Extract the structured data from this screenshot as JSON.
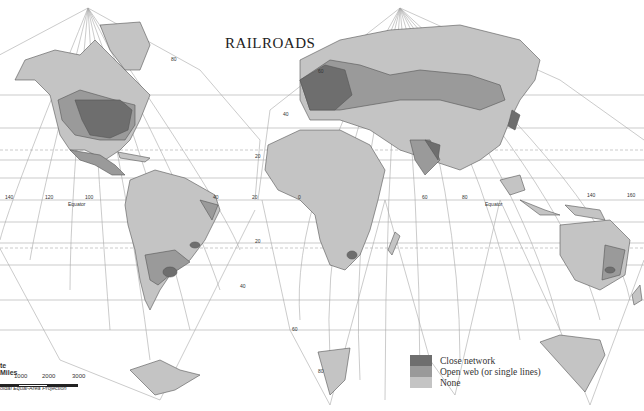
{
  "map": {
    "title": "RAILROADS",
    "projection": "Interrupted Homolosine (Goode) — Equal-Area Projection",
    "projection_label_visible": "oidal Equal-Area Projection",
    "equator_label": "Equator",
    "longitude_labels": [
      "140",
      "120",
      "100",
      "80",
      "40",
      "20",
      "0",
      "20",
      "60",
      "80",
      "140",
      "160"
    ],
    "latitude_labels": [
      "80",
      "60",
      "40",
      "20",
      "20",
      "40",
      "60",
      "80"
    ],
    "colors": {
      "close_network": "#6e6e6e",
      "open_web": "#9a9a9a",
      "none": "#c4c4c4",
      "ocean": "#ffffff",
      "graticule": "#9a9a9a"
    }
  },
  "legend": {
    "items": [
      {
        "label": "Close network",
        "color": "#6e6e6e"
      },
      {
        "label": "Open web (or single lines)",
        "color": "#9a9a9a"
      },
      {
        "label": "None",
        "color": "#c4c4c4"
      }
    ]
  },
  "scale": {
    "title": "te Miles",
    "ticks": [
      "1000",
      "2000",
      "3000"
    ]
  }
}
